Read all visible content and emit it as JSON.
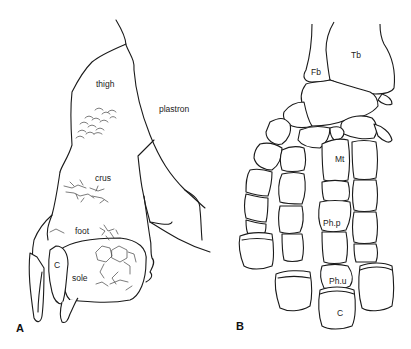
{
  "figure": {
    "panel_a": {
      "letter": "A",
      "labels": {
        "thigh": "thigh",
        "plastron": "plastron",
        "crus": "crus",
        "foot": "foot",
        "sole": "sole",
        "claw": "C"
      }
    },
    "panel_b": {
      "letter": "B",
      "labels": {
        "tibia": "Tb",
        "fibula": "Fb",
        "metatarsal": "Mt",
        "proximal_phalanx": "Ph.p",
        "ungual_phalanx": "Ph.u",
        "claw": "C"
      }
    }
  }
}
